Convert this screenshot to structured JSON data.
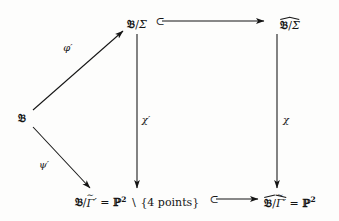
{
  "diagram": {
    "type": "commutative-diagram",
    "nodes": [
      {
        "id": "source",
        "label": "𝔅",
        "plain": "B",
        "x": 22,
        "y": 118
      },
      {
        "id": "top-left",
        "label": "𝔅/Σ",
        "plain": "B/Sigma",
        "x": 137,
        "y": 24
      },
      {
        "id": "top-right",
        "label": "𝔅/Σ",
        "accent": "widehat",
        "plain": "hat(B/Sigma)",
        "x": 290,
        "y": 24
      },
      {
        "id": "bottom-left",
        "label": "𝔅/Γ̃′ = ℙ² ∖ {4 points}",
        "plain": "B/Gamma-tilde-prime = P^2 minus {4 points}",
        "x": 137,
        "y": 202
      },
      {
        "id": "bottom-right",
        "label": "𝔅/Γ̃′ = ℙ²",
        "accent": "widehat",
        "plain": "hat(B/Gamma-tilde-prime) = P^2",
        "x": 290,
        "y": 202
      }
    ],
    "node_text": {
      "frak_b": "𝔅",
      "slash": "/",
      "sigma": "Σ",
      "gamma": "Γ",
      "tilde": "∼",
      "prime": "′",
      "equals": "=",
      "blackboard_p": "ℙ",
      "exponent_two": "2",
      "setminus": "∖",
      "four_points": "{4 points}"
    },
    "arrows": [
      {
        "id": "phi-prime",
        "label": "φ′",
        "from": "source",
        "to": "top-left",
        "kind": "mapsto",
        "label_x": 68,
        "label_y": 47
      },
      {
        "id": "psi-prime",
        "label": "ψ′",
        "from": "source",
        "to": "bottom-left",
        "kind": "mapsto",
        "label_x": 44,
        "label_y": 164
      },
      {
        "id": "chi-prime",
        "label": "χ′",
        "from": "top-left",
        "to": "bottom-left",
        "kind": "vertical",
        "label_x": 146,
        "label_y": 119
      },
      {
        "id": "chi",
        "label": "χ",
        "from": "top-right",
        "to": "bottom-right",
        "kind": "vertical",
        "label_x": 286,
        "label_y": 119
      },
      {
        "id": "top-inclusion",
        "label": "⊂",
        "from": "top-left",
        "to": "top-right",
        "kind": "hooked-inclusion",
        "label_x": 160,
        "label_y": 21
      },
      {
        "id": "bottom-inclusion",
        "label": "⊂",
        "from": "bottom-left",
        "to": "bottom-right",
        "kind": "hooked-inclusion",
        "label_x": 214,
        "label_y": 199
      }
    ],
    "colors": {
      "ink": "#141414",
      "background": "#fdfdfc"
    }
  }
}
